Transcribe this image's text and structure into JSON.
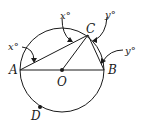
{
  "diagram": {
    "type": "circle-geometry",
    "points": {
      "A": "A",
      "B": "B",
      "C": "C",
      "O": "O",
      "D": "D"
    },
    "angles": {
      "angle_at_A": "x°",
      "angle_at_C_left": "x°",
      "angle_at_C_right": "y°",
      "angle_at_B": "y°"
    },
    "colors": {
      "stroke": "#1a1a1a",
      "background": "#ffffff"
    }
  }
}
